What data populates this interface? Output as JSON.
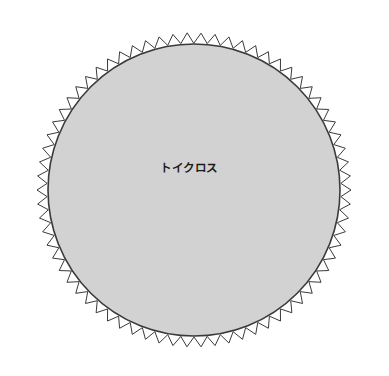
{
  "canvas": {
    "width": 389,
    "height": 376,
    "background_color": "#ffffff"
  },
  "figure": {
    "name": "pinked-edge-fabric-circle",
    "label": "トイクロス",
    "label_position": {
      "x": 189,
      "y": 168
    },
    "label_color": "#1a1a1a",
    "label_font_size": 11.5,
    "center": {
      "x": 194,
      "y": 190
    },
    "disc": {
      "radius": 146,
      "fill_color": "#d2d2d2",
      "stroke_color": "#3a3a3a",
      "stroke_width": 1.6
    },
    "pinked_edge": {
      "teeth": 70,
      "inner_radius": 147,
      "outer_radius": 157,
      "stroke_color": "#3a3a3a",
      "stroke_width": 1,
      "fill": "none"
    }
  }
}
